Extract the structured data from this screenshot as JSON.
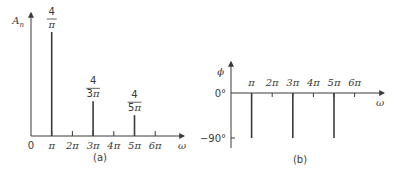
{
  "chart_data": [
    {
      "type": "bar",
      "subtype": "stem",
      "title": "",
      "caption": "(a)",
      "xlabel": "ω",
      "ylabel": "A",
      "ylabel_sub": "n",
      "x_ticks": [
        0,
        1,
        2,
        3,
        4,
        5,
        6
      ],
      "x_tick_labels": [
        "0",
        "π",
        "2π",
        "3π",
        "4π",
        "5π",
        "6π"
      ],
      "x_unit": "π",
      "xlim": [
        0,
        6.5
      ],
      "ylim": [
        0,
        1.4
      ],
      "grid": false,
      "points": [
        {
          "x": 1,
          "value": 1.2732,
          "label_num": "4",
          "label_den": "π"
        },
        {
          "x": 3,
          "value": 0.4244,
          "label_num": "4",
          "label_den": "3π"
        },
        {
          "x": 5,
          "value": 0.2546,
          "label_num": "4",
          "label_den": "5π"
        }
      ]
    },
    {
      "type": "bar",
      "subtype": "stem",
      "title": "",
      "caption": "(b)",
      "xlabel": "ω",
      "ylabel": "ϕ",
      "x_ticks": [
        1,
        2,
        3,
        4,
        5,
        6
      ],
      "x_tick_labels": [
        "π",
        "2π",
        "3π",
        "4π",
        "5π",
        "6π"
      ],
      "x_unit": "π",
      "y_ticks": [
        0,
        -90
      ],
      "y_tick_labels": [
        "0°",
        "−90°"
      ],
      "xlim": [
        0,
        6.5
      ],
      "ylim": [
        -100,
        30
      ],
      "grid": false,
      "points": [
        {
          "x": 1,
          "value": -90
        },
        {
          "x": 3,
          "value": -90
        },
        {
          "x": 5,
          "value": -90
        }
      ]
    }
  ]
}
